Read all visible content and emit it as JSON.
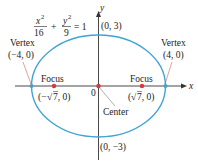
{
  "equation": {
    "x_num": "x",
    "x_exp": "2",
    "x_den": "16",
    "plus": "+",
    "y_num": "y",
    "y_exp": "2",
    "y_den": "9",
    "equals": "= 1"
  },
  "axes": {
    "x_label": "x",
    "y_label": "y",
    "origin_label": "0"
  },
  "points": {
    "top": "(0, 3)",
    "bottom": "(0, −3)",
    "left_vertex_title": "Vertex",
    "left_vertex_coord": "(−4, 0)",
    "right_vertex_title": "Vertex",
    "right_vertex_coord": "(4, 0)",
    "left_focus_title": "Focus",
    "left_focus_coord_prefix": "(−",
    "left_focus_coord_root": "7, 0)",
    "right_focus_title": "Focus",
    "right_focus_coord_prefix": "(",
    "right_focus_coord_root": "7, 0)",
    "center_label": "Center"
  },
  "colors": {
    "ellipse": "#3fa3d6",
    "focus": "#d9383a",
    "vertex": "#3fa3d6",
    "axis": "#333333",
    "leader": "#c06a5a"
  }
}
